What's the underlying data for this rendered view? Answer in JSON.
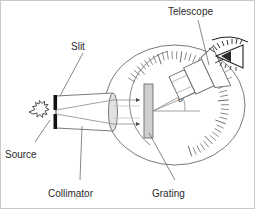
{
  "figure": {
    "type": "optics-diagram",
    "background_color": "#ffffff",
    "border_color": "#c9c9c9",
    "line_color": "#4a4a4a",
    "fill_color": "#d0d0d0",
    "text_color": "#2b2b2b"
  },
  "labels": {
    "telescope": "Telescope",
    "slit": "Slit",
    "source": "Source",
    "collimator": "Collimator",
    "grating": "Grating",
    "theta": "θ"
  },
  "parts": {
    "source": {
      "name": "Source",
      "icon": "star-burst-icon",
      "x": 32,
      "y": 112
    },
    "slit": {
      "name": "Slit",
      "icon": "slit-bar-icon",
      "x": 57,
      "y": 112
    },
    "collimator": {
      "name": "Collimator",
      "icon": "collimator-tube-icon",
      "x": 95,
      "y": 112
    },
    "grating": {
      "name": "Grating",
      "icon": "grating-plate-icon",
      "x": 150,
      "y": 111
    },
    "telescope": {
      "name": "Telescope",
      "icon": "telescope-tube-icon",
      "x": 205,
      "y": 76
    },
    "eye": {
      "name": "Eye",
      "icon": "eye-icon",
      "x": 228,
      "y": 56
    },
    "stage": {
      "name": "Circular graduated stage",
      "icon": "circle-stage-icon",
      "center_x": 175,
      "center_y": 105,
      "radius_x": 70,
      "radius_y": 60
    },
    "vernier_scale": {
      "name": "Graduated angle scale",
      "icon": "tick-scale-icon",
      "tick_count": 44
    }
  },
  "chart_data": {
    "type": "diagram",
    "annotations": [
      {
        "label": "Telescope",
        "target": "telescope-tube"
      },
      {
        "label": "Slit",
        "target": "slit-bar"
      },
      {
        "label": "Source",
        "target": "source-star"
      },
      {
        "label": "Collimator",
        "target": "collimator-tube"
      },
      {
        "label": "Grating",
        "target": "grating-plate"
      },
      {
        "label": "θ",
        "target": "diffraction-angle"
      }
    ],
    "angle_theta_degrees": 22
  }
}
